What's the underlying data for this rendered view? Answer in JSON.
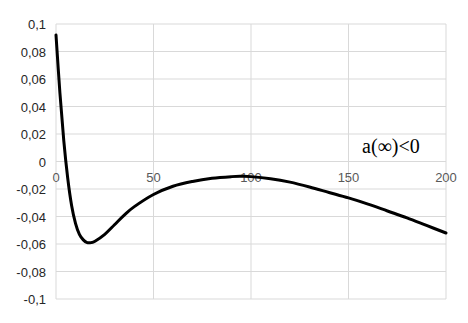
{
  "chart_data": {
    "type": "line",
    "title": "",
    "xlabel": "",
    "ylabel": "",
    "xlim": [
      0,
      200
    ],
    "ylim": [
      -0.1,
      0.1
    ],
    "x_ticks": [
      0,
      50,
      100,
      150,
      200
    ],
    "x_tick_labels": [
      "0",
      "50",
      "100",
      "150",
      "200"
    ],
    "y_ticks": [
      0.1,
      0.08,
      0.06,
      0.04,
      0.02,
      0,
      -0.02,
      -0.04,
      -0.06,
      -0.08,
      -0.1
    ],
    "y_tick_labels": [
      "0,1",
      "0,08",
      "0,06",
      "0,04",
      "0,02",
      "0",
      "-0,02",
      "-0,04",
      "-0,06",
      "-0,08",
      "-0,1"
    ],
    "grid": true,
    "legend": "none",
    "annotation": "a(∞)<0",
    "series": [
      {
        "name": "a",
        "color": "#000000",
        "x": [
          0,
          2,
          4,
          6,
          8,
          10,
          12,
          14,
          16,
          18,
          20,
          25,
          30,
          35,
          40,
          50,
          60,
          70,
          80,
          90,
          95,
          100,
          110,
          120,
          130,
          140,
          150,
          160,
          170,
          180,
          190,
          200
        ],
        "y": [
          0.092,
          0.05,
          0.015,
          -0.012,
          -0.032,
          -0.045,
          -0.053,
          -0.057,
          -0.059,
          -0.059,
          -0.058,
          -0.053,
          -0.046,
          -0.039,
          -0.033,
          -0.024,
          -0.018,
          -0.0145,
          -0.0122,
          -0.011,
          -0.0108,
          -0.011,
          -0.0125,
          -0.015,
          -0.0185,
          -0.0225,
          -0.0265,
          -0.031,
          -0.036,
          -0.041,
          -0.0465,
          -0.052
        ]
      }
    ]
  }
}
